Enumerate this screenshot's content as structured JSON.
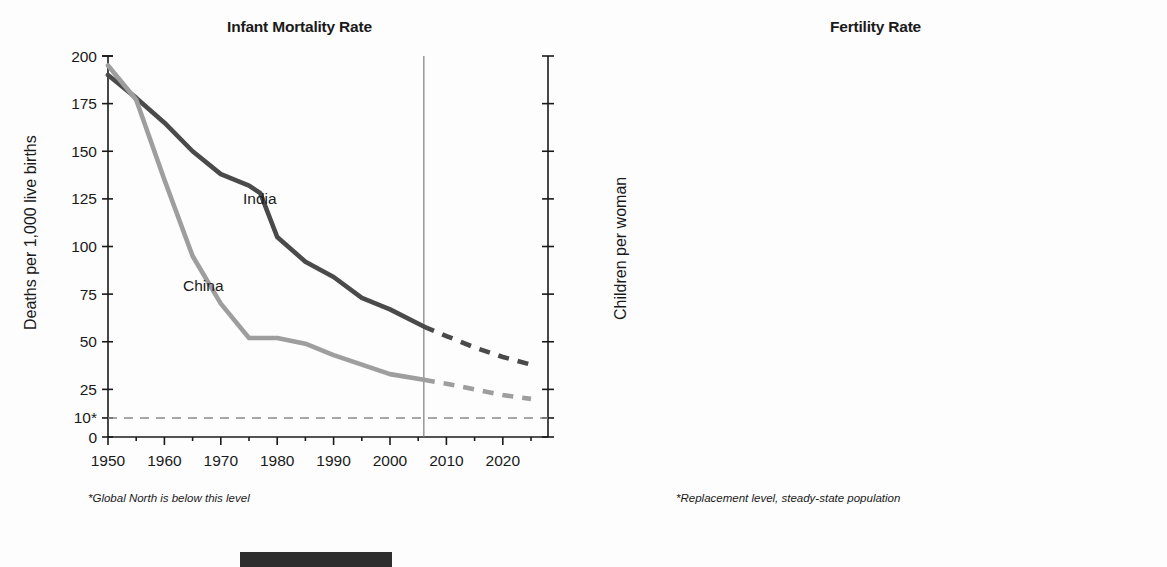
{
  "figure": {
    "footer_block_color": "#2e2e2e"
  },
  "colors": {
    "india": "#4a4a4a",
    "china": "#9e9e9e",
    "axis": "#1a1a1a",
    "divider": "#7d7d7d",
    "reference": "#8a8a8a"
  },
  "panels": [
    {
      "id": "infant-mortality",
      "title": "Infant Mortality Rate",
      "ylabel": "Deaths per 1,000 live births",
      "footnote": "*Global North is below this level",
      "y_ticks": [
        "200",
        "175",
        "150",
        "125",
        "100",
        "75",
        "50",
        "25",
        "10*",
        "0"
      ],
      "x_ticks": [
        "1950",
        "1960",
        "1970",
        "1980",
        "1990",
        "2000",
        "2010",
        "2020"
      ]
    },
    {
      "id": "fertility",
      "title": "Fertility Rate",
      "ylabel": "Children per woman",
      "footnote": "*Replacement level, steady-state population",
      "y_ticks": [
        "7",
        "6",
        "5",
        "4",
        "3",
        "2*",
        "1",
        "0"
      ],
      "x_ticks": [
        "1950",
        "1960",
        "1970",
        "1980",
        "1990",
        "2000",
        "2010",
        "2020"
      ]
    }
  ],
  "series_labels": {
    "india": "India",
    "china": "China"
  },
  "chart_data": [
    {
      "type": "line",
      "title": "Infant Mortality Rate",
      "xlabel": "",
      "ylabel": "Deaths per 1,000 live births",
      "xlim": [
        1950,
        2025
      ],
      "ylim": [
        0,
        200
      ],
      "yticks": [
        0,
        10,
        25,
        50,
        75,
        100,
        125,
        150,
        175,
        200
      ],
      "ytick_labels": [
        "0",
        "10*",
        "25",
        "50",
        "75",
        "100",
        "125",
        "150",
        "175",
        "200"
      ],
      "xticks": [
        1950,
        1960,
        1970,
        1980,
        1990,
        2000,
        2010,
        2020
      ],
      "minor_xticks": [
        1955,
        1965,
        1975,
        1985,
        1995,
        2005,
        2015,
        2025
      ],
      "grid": false,
      "legend": "inline-labels",
      "reference_line": {
        "y": 10,
        "style": "dashed",
        "note": "*Global North is below this level"
      },
      "projection_divider_x": 2006,
      "series": [
        {
          "name": "India",
          "color": "#4a4a4a",
          "observed": {
            "x": [
              1950,
              1955,
              1960,
              1965,
              1970,
              1975,
              1977,
              1980,
              1985,
              1990,
              1995,
              2000,
              2006
            ],
            "y": [
              190,
              178,
              165,
              150,
              138,
              132,
              128,
              105,
              92,
              84,
              73,
              67,
              58
            ]
          },
          "projected": {
            "x": [
              2006,
              2010,
              2015,
              2020,
              2025
            ],
            "y": [
              58,
              53,
              47,
              42,
              38
            ]
          }
        },
        {
          "name": "China",
          "color": "#9e9e9e",
          "observed": {
            "x": [
              1950,
              1955,
              1960,
              1965,
              1970,
              1975,
              1980,
              1985,
              1990,
              1995,
              2000,
              2006
            ],
            "y": [
              195,
              177,
              135,
              95,
              70,
              52,
              52,
              49,
              43,
              38,
              33,
              30
            ]
          },
          "projected": {
            "x": [
              2006,
              2010,
              2015,
              2020,
              2025
            ],
            "y": [
              30,
              28,
              25,
              22,
              20
            ]
          }
        }
      ]
    },
    {
      "type": "line",
      "title": "Fertility Rate",
      "xlabel": "",
      "ylabel": "Children per woman",
      "xlim": [
        1950,
        2025
      ],
      "ylim": [
        0,
        7
      ],
      "yticks": [
        0,
        1,
        2,
        3,
        4,
        5,
        6,
        7
      ],
      "ytick_labels": [
        "0",
        "1",
        "2*",
        "3",
        "4",
        "5",
        "6",
        "7"
      ],
      "xticks": [
        1950,
        1960,
        1970,
        1980,
        1990,
        2000,
        2010,
        2020
      ],
      "minor_xticks": [
        1955,
        1965,
        1975,
        1985,
        1995,
        2005,
        2015,
        2025
      ],
      "grid": false,
      "legend": "inline-labels",
      "reference_line": {
        "y": 2,
        "style": "dashed",
        "note": "*Replacement level, steady-state population"
      },
      "projection_divider_x": 2006,
      "series": [
        {
          "name": "India",
          "color": "#4a4a4a",
          "observed": {
            "x": [
              1950,
              1955,
              1960,
              1965,
              1970,
              1975,
              1980,
              1985,
              1990,
              1995,
              2000,
              2006
            ],
            "y": [
              5.95,
              5.9,
              5.85,
              5.75,
              5.55,
              5.05,
              4.75,
              4.4,
              4.0,
              3.6,
              3.2,
              2.75
            ]
          },
          "projected": {
            "x": [
              2006,
              2010,
              2015,
              2020,
              2025
            ],
            "y": [
              2.75,
              2.5,
              2.25,
              2.05,
              2.0
            ]
          }
        },
        {
          "name": "China",
          "color": "#9e9e9e",
          "observed": {
            "x": [
              1950,
              1955,
              1960,
              1965,
              1970,
              1975,
              1980,
              1985,
              1990,
              1995,
              2000,
              2006
            ],
            "y": [
              6.15,
              5.55,
              5.7,
              6.05,
              4.8,
              3.3,
              2.5,
              2.45,
              1.95,
              1.78,
              1.7,
              1.75
            ]
          },
          "projected": {
            "x": [
              2006,
              2010,
              2015,
              2020,
              2025
            ],
            "y": [
              1.75,
              1.78,
              1.8,
              1.8,
              1.8
            ]
          }
        }
      ]
    }
  ]
}
